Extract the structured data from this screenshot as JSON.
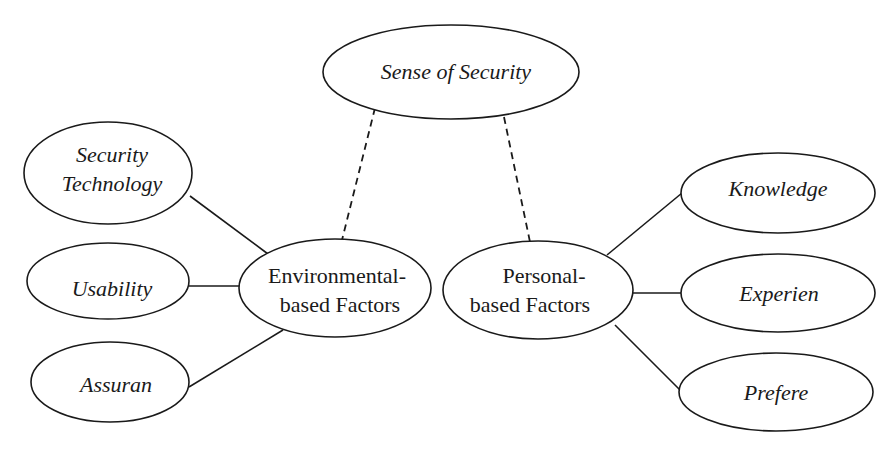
{
  "diagram": {
    "nodes": {
      "sense_of_security": {
        "label": "Sense of Security"
      },
      "security_technology": {
        "label_line1": "Security",
        "label_line2": "Technology"
      },
      "usability": {
        "label": "Usability"
      },
      "assurance": {
        "label": "Assuran"
      },
      "environmental": {
        "label_line1": "Environmental-",
        "label_line2": "based Factors"
      },
      "personal": {
        "label_line1": "Personal-",
        "label_line2": "based Factors"
      },
      "knowledge": {
        "label": "Knowledge"
      },
      "experience": {
        "label": "Experien"
      },
      "preference": {
        "label": "Prefere"
      }
    },
    "edges": [
      {
        "from": "Security Technology",
        "to": "Environmental-based Factors",
        "style": "solid"
      },
      {
        "from": "Usability",
        "to": "Environmental-based Factors",
        "style": "solid"
      },
      {
        "from": "Assuran",
        "to": "Environmental-based Factors",
        "style": "solid"
      },
      {
        "from": "Sense of Security",
        "to": "Environmental-based Factors",
        "style": "dashed"
      },
      {
        "from": "Sense of Security",
        "to": "Personal-based Factors",
        "style": "dashed"
      },
      {
        "from": "Knowledge",
        "to": "Personal-based Factors",
        "style": "solid"
      },
      {
        "from": "Experien",
        "to": "Personal-based Factors",
        "style": "solid"
      },
      {
        "from": "Prefere",
        "to": "Personal-based Factors",
        "style": "solid"
      }
    ],
    "colors": {
      "stroke": "#1a1a1a",
      "background": "#ffffff"
    }
  }
}
